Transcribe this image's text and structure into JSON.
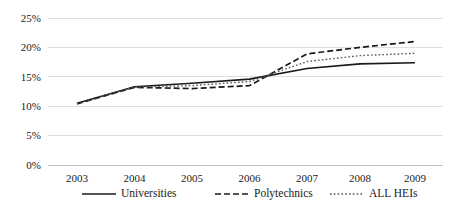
{
  "chart_data": {
    "type": "line",
    "title": "",
    "subtitle": "",
    "xlabel": "",
    "ylabel": "",
    "x": [
      "2003",
      "2004",
      "2005",
      "2006",
      "2007",
      "2008",
      "2009"
    ],
    "categories": [
      "2003",
      "2004",
      "2005",
      "2006",
      "2007",
      "2008",
      "2009"
    ],
    "ylim": [
      0,
      25
    ],
    "ytick_values": [
      0,
      5,
      10,
      15,
      20,
      25
    ],
    "ytick_labels": [
      "0%",
      "5%",
      "10%",
      "15%",
      "20%",
      "25%"
    ],
    "xtick_labels": [
      "2003",
      "2004",
      "2005",
      "2006",
      "2007",
      "2008",
      "2009"
    ],
    "grid": "horizontal",
    "legend_position": "bottom",
    "value_suffix": "%",
    "series": [
      {
        "name": "Universities",
        "style": "solid",
        "color": "#1a1a1a",
        "width": 1.6,
        "dash": "",
        "values": [
          10.5,
          13.3,
          13.9,
          14.6,
          16.4,
          17.2,
          17.4
        ]
      },
      {
        "name": "Polytechnics",
        "style": "dashed",
        "color": "#1a1a1a",
        "width": 1.7,
        "dash": "6,3",
        "values": [
          10.4,
          13.2,
          13.0,
          13.5,
          18.9,
          20.0,
          21.0
        ]
      },
      {
        "name": "ALL HEIs",
        "style": "dotted",
        "color": "#555555",
        "width": 1.4,
        "dash": "1.6,2.2",
        "values": [
          10.45,
          13.25,
          13.5,
          14.2,
          17.6,
          18.6,
          19.0
        ]
      }
    ]
  },
  "legend": {
    "entries": [
      {
        "label": "Universities"
      },
      {
        "label": "Polytechnics"
      },
      {
        "label": "ALL HEIs"
      }
    ]
  }
}
